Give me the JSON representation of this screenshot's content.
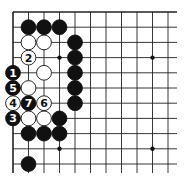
{
  "board": {
    "origin": [
      13,
      12
    ],
    "col_spacing": 15.5,
    "row_spacing": 15.2,
    "cols": 11,
    "rows": 11,
    "right_edge_extends": true,
    "bottom_edge_extends": true,
    "line_color": "#222222",
    "background": "#ffffff",
    "star_points": [
      [
        3,
        3
      ],
      [
        9,
        3
      ],
      [
        3,
        9
      ],
      [
        9,
        9
      ]
    ]
  },
  "stones": [
    {
      "color": "black",
      "col": 1,
      "row": 1,
      "label": ""
    },
    {
      "color": "black",
      "col": 2,
      "row": 1,
      "label": ""
    },
    {
      "color": "black",
      "col": 3,
      "row": 1,
      "label": ""
    },
    {
      "color": "white",
      "col": 1,
      "row": 2,
      "label": ""
    },
    {
      "color": "white",
      "col": 2,
      "row": 2,
      "label": ""
    },
    {
      "color": "black",
      "col": 4,
      "row": 2,
      "label": ""
    },
    {
      "color": "white",
      "col": 1,
      "row": 3,
      "label": "2"
    },
    {
      "color": "black",
      "col": 4,
      "row": 3,
      "label": ""
    },
    {
      "color": "black",
      "col": 0,
      "row": 4,
      "label": "1"
    },
    {
      "color": "white",
      "col": 2,
      "row": 4,
      "label": ""
    },
    {
      "color": "black",
      "col": 4,
      "row": 4,
      "label": ""
    },
    {
      "color": "black",
      "col": 0,
      "row": 5,
      "label": "5"
    },
    {
      "color": "white",
      "col": 1,
      "row": 5,
      "label": ""
    },
    {
      "color": "black",
      "col": 4,
      "row": 5,
      "label": ""
    },
    {
      "color": "white",
      "col": 0,
      "row": 6,
      "label": "4"
    },
    {
      "color": "black",
      "col": 1,
      "row": 6,
      "label": "7"
    },
    {
      "color": "white",
      "col": 2,
      "row": 6,
      "label": "6"
    },
    {
      "color": "black",
      "col": 4,
      "row": 6,
      "label": ""
    },
    {
      "color": "black",
      "col": 0,
      "row": 7,
      "label": "3"
    },
    {
      "color": "white",
      "col": 1,
      "row": 7,
      "label": ""
    },
    {
      "color": "white",
      "col": 2,
      "row": 7,
      "label": ""
    },
    {
      "color": "black",
      "col": 3,
      "row": 7,
      "label": ""
    },
    {
      "color": "black",
      "col": 1,
      "row": 8,
      "label": ""
    },
    {
      "color": "black",
      "col": 2,
      "row": 8,
      "label": ""
    },
    {
      "color": "black",
      "col": 3,
      "row": 8,
      "label": ""
    },
    {
      "color": "black",
      "col": 1,
      "row": 10,
      "label": ""
    }
  ]
}
